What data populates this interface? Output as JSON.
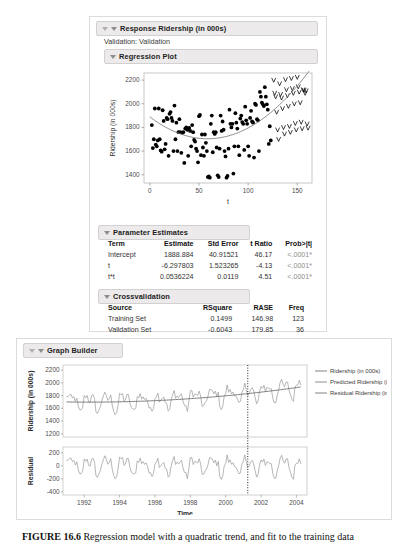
{
  "report": {
    "response_header": "Response Ridership (in 000s)",
    "validation_line": "Validation: Validation",
    "regression_plot_header": "Regression Plot",
    "parameter_estimates_header": "Parameter Estimates",
    "crossvalidation_header": "Crossvalidation",
    "parameter_estimates": {
      "columns": [
        "Term",
        "Estimate",
        "Std Error",
        "t Ratio",
        "Prob>|t|"
      ],
      "rows": [
        {
          "term": "Intercept",
          "estimate": "1888.884",
          "std_error": "40.91521",
          "t_ratio": "46.17",
          "prob": "<.0001*"
        },
        {
          "term": "t",
          "estimate": "-6.297803",
          "std_error": "1.523265",
          "t_ratio": "-4.13",
          "prob": "<.0001*"
        },
        {
          "term": "t*t",
          "estimate": "0.0536224",
          "std_error": "0.0119",
          "t_ratio": "4.51",
          "prob": "<.0001*"
        }
      ]
    },
    "crossvalidation": {
      "columns": [
        "Source",
        "RSquare",
        "RASE",
        "Freq"
      ],
      "rows": [
        {
          "source": "Training Set",
          "rsquare": "0.1499",
          "rase": "146.98",
          "freq": "123"
        },
        {
          "source": "Validation Set",
          "rsquare": "-0.6043",
          "rase": "179.85",
          "freq": "36"
        }
      ]
    }
  },
  "graph_builder": {
    "header": "Graph Builder",
    "legend": [
      {
        "label": "Ridership (in 000s)",
        "color": "#8f8f8f"
      },
      {
        "label": "Predicted Ridership (in 000s)",
        "color": "#9a9a9a"
      },
      {
        "label": "Residual Ridership (in 000s)",
        "color": "#8f8f8f"
      }
    ]
  },
  "caption": {
    "figure_number": "FIGURE 16.6",
    "text": "Regression model with a quadratic trend, and fit to the training data"
  },
  "chart_data": [
    {
      "type": "scatter",
      "title": "Regression Plot",
      "xlabel": "t",
      "ylabel": "Ridership (in 000s)",
      "xlim": [
        -6,
        165
      ],
      "ylim": [
        1330,
        2260
      ],
      "xticks": [
        0,
        50,
        100,
        150
      ],
      "yticks": [
        1400,
        1600,
        1800,
        2000,
        2200
      ],
      "grid": false,
      "series": [
        {
          "name": "Training (dots)",
          "marker": "filled-circle",
          "color": "#000000",
          "points": [
            [
              2,
              1820
            ],
            [
              3,
              1625
            ],
            [
              4,
              1700
            ],
            [
              5,
              1960
            ],
            [
              6,
              1655
            ],
            [
              7,
              1640
            ],
            [
              8,
              1690
            ],
            [
              9,
              1960
            ],
            [
              10,
              1700
            ],
            [
              11,
              1605
            ],
            [
              12,
              1595
            ],
            [
              13,
              1945
            ],
            [
              14,
              1855
            ],
            [
              15,
              1615
            ],
            [
              16,
              1660
            ],
            [
              17,
              1880
            ],
            [
              18,
              1870
            ],
            [
              19,
              1560
            ],
            [
              20,
              1915
            ],
            [
              21,
              1930
            ],
            [
              22,
              1880
            ],
            [
              23,
              1855
            ],
            [
              24,
              1600
            ],
            [
              25,
              1985
            ],
            [
              26,
              1700
            ],
            [
              27,
              1840
            ],
            [
              28,
              1600
            ],
            [
              29,
              1760
            ],
            [
              30,
              1870
            ],
            [
              31,
              1760
            ],
            [
              32,
              1585
            ],
            [
              33,
              1755
            ],
            [
              34,
              1760
            ],
            [
              35,
              1500
            ],
            [
              36,
              1790
            ],
            [
              37,
              1800
            ],
            [
              38,
              1780
            ],
            [
              39,
              1560
            ],
            [
              40,
              1795
            ],
            [
              41,
              1770
            ],
            [
              42,
              1640
            ],
            [
              43,
              1820
            ],
            [
              44,
              1760
            ],
            [
              45,
              1695
            ],
            [
              46,
              1680
            ],
            [
              47,
              1620
            ],
            [
              48,
              1600
            ],
            [
              49,
              1505
            ],
            [
              50,
              1895
            ],
            [
              51,
              1905
            ],
            [
              52,
              1565
            ],
            [
              53,
              1740
            ],
            [
              54,
              1630
            ],
            [
              55,
              1560
            ],
            [
              56,
              1740
            ],
            [
              57,
              1670
            ],
            [
              58,
              1600
            ],
            [
              59,
              1380
            ],
            [
              60,
              1385
            ],
            [
              61,
              1375
            ],
            [
              62,
              1830
            ],
            [
              63,
              1900
            ],
            [
              64,
              1590
            ],
            [
              65,
              1760
            ],
            [
              66,
              1745
            ],
            [
              67,
              1760
            ],
            [
              68,
              1630
            ],
            [
              69,
              1395
            ],
            [
              70,
              1380
            ],
            [
              71,
              1620
            ],
            [
              72,
              1900
            ],
            [
              73,
              1770
            ],
            [
              74,
              1850
            ],
            [
              75,
              1780
            ],
            [
              76,
              1600
            ],
            [
              77,
              1555
            ],
            [
              78,
              1375
            ],
            [
              79,
              1390
            ],
            [
              80,
              1620
            ],
            [
              81,
              1950
            ],
            [
              82,
              1830
            ],
            [
              83,
              1800
            ],
            [
              84,
              1830
            ],
            [
              85,
              1410
            ],
            [
              86,
              1640
            ],
            [
              87,
              1920
            ],
            [
              88,
              1840
            ],
            [
              89,
              1790
            ],
            [
              90,
              1640
            ],
            [
              91,
              1565
            ],
            [
              92,
              1875
            ],
            [
              93,
              1900
            ],
            [
              94,
              1845
            ],
            [
              95,
              1830
            ],
            [
              96,
              1610
            ],
            [
              97,
              1975
            ],
            [
              98,
              1860
            ],
            [
              99,
              1830
            ],
            [
              100,
              1640
            ],
            [
              101,
              1560
            ],
            [
              102,
              1880
            ],
            [
              103,
              1940
            ],
            [
              104,
              1850
            ],
            [
              105,
              1840
            ],
            [
              106,
              1545
            ],
            [
              107,
              2000
            ],
            [
              108,
              1990
            ],
            [
              109,
              1870
            ],
            [
              110,
              1860
            ],
            [
              111,
              1600
            ],
            [
              112,
              2100
            ],
            [
              113,
              2060
            ],
            [
              114,
              2010
            ],
            [
              115,
              1995
            ],
            [
              116,
              1980
            ],
            [
              117,
              2140
            ],
            [
              118,
              2060
            ],
            [
              119,
              1995
            ],
            [
              120,
              1950
            ],
            [
              121,
              1660
            ],
            [
              122,
              1810
            ],
            [
              123,
              1690
            ]
          ]
        },
        {
          "name": "Validation (v marks)",
          "marker": "v-glyph",
          "color": "#000000",
          "points": [
            [
              126,
              2200
            ],
            [
              127,
              2090
            ],
            [
              128,
              2060
            ],
            [
              129,
              1930
            ],
            [
              130,
              1780
            ],
            [
              131,
              1700
            ],
            [
              132,
              2170
            ],
            [
              133,
              2080
            ],
            [
              134,
              2050
            ],
            [
              135,
              1960
            ],
            [
              136,
              1800
            ],
            [
              137,
              1745
            ],
            [
              138,
              2205
            ],
            [
              139,
              2120
            ],
            [
              140,
              2070
            ],
            [
              141,
              1980
            ],
            [
              142,
              1810
            ],
            [
              143,
              1760
            ],
            [
              144,
              2215
            ],
            [
              145,
              2130
            ],
            [
              146,
              2090
            ],
            [
              147,
              2000
            ],
            [
              148,
              1835
            ],
            [
              149,
              1780
            ],
            [
              150,
              2225
            ],
            [
              151,
              2145
            ],
            [
              152,
              2100
            ],
            [
              153,
              2010
            ],
            [
              154,
              1845
            ],
            [
              155,
              1790
            ],
            [
              156,
              2120
            ],
            [
              157,
              2115
            ],
            [
              158,
              2090
            ],
            [
              159,
              2110
            ],
            [
              160,
              1830
            ],
            [
              161,
              1795
            ]
          ]
        },
        {
          "name": "Quadratic fit",
          "marker": "line",
          "color": "#777777",
          "equation": "1888.884 - 6.297803*t + 0.0536224*t*t"
        }
      ]
    },
    {
      "type": "line",
      "title": "Graph Builder",
      "xlabel": "Time",
      "panels": [
        {
          "ylabel": "Ridership (in 000s)",
          "ylim": [
            1150,
            2280
          ],
          "yticks": [
            1200,
            1400,
            1600,
            1800,
            2000,
            2200
          ],
          "series": [
            "Ridership (in 000s)",
            "Predicted Ridership (in 000s)"
          ]
        },
        {
          "ylabel": "Residual",
          "ylim": [
            -450,
            290
          ],
          "yticks": [
            -400,
            -200,
            0,
            200
          ],
          "series": [
            "Residual Ridership (in 000s)"
          ]
        }
      ],
      "xlim": [
        1990.8,
        2004.6
      ],
      "xticks": [
        1992,
        1994,
        1996,
        1998,
        2000,
        2002,
        2004
      ],
      "annotations": [
        {
          "type": "vline",
          "x": 2001.25,
          "style": "dotted",
          "label": "training/validation split"
        }
      ]
    }
  ]
}
